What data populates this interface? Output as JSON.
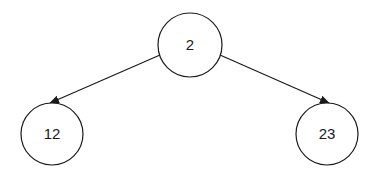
{
  "diagram": {
    "type": "binary-tree",
    "nodes": [
      {
        "id": "root",
        "label": "2",
        "cx": 190,
        "cy": 45,
        "r": 32
      },
      {
        "id": "left",
        "label": "12",
        "cx": 52,
        "cy": 134,
        "r": 31
      },
      {
        "id": "right",
        "label": "23",
        "cx": 327,
        "cy": 134,
        "r": 31
      }
    ],
    "edges": [
      {
        "from": "root",
        "to": "left"
      },
      {
        "from": "root",
        "to": "right"
      }
    ],
    "colors": {
      "stroke": "#1a1a1a",
      "background": "#ffffff"
    }
  }
}
